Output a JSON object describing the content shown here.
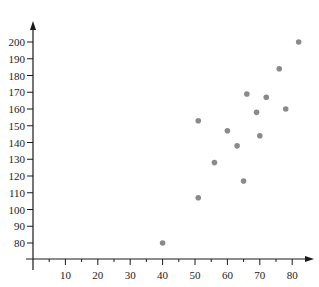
{
  "chart_data": {
    "type": "scatter",
    "title": "",
    "xlabel": "",
    "ylabel": "",
    "xlim": [
      0,
      85
    ],
    "ylim": [
      70,
      205
    ],
    "x_ticks": [
      10,
      20,
      30,
      40,
      50,
      60,
      70,
      80
    ],
    "x_minor_ticks": [
      5,
      15,
      25,
      35,
      45,
      55,
      65,
      75
    ],
    "y_ticks": [
      80,
      90,
      100,
      110,
      120,
      130,
      140,
      150,
      160,
      170,
      180,
      190,
      200
    ],
    "grid": false,
    "legend": null,
    "point_color": "#8a8a8a",
    "axis_color": "#1a1a1a",
    "series": [
      {
        "name": "data",
        "points": [
          {
            "x": 40,
            "y": 80
          },
          {
            "x": 51,
            "y": 107
          },
          {
            "x": 56,
            "y": 128
          },
          {
            "x": 65,
            "y": 117
          },
          {
            "x": 63,
            "y": 138
          },
          {
            "x": 60,
            "y": 147
          },
          {
            "x": 70,
            "y": 144
          },
          {
            "x": 51,
            "y": 153
          },
          {
            "x": 69,
            "y": 158
          },
          {
            "x": 78,
            "y": 160
          },
          {
            "x": 66,
            "y": 169
          },
          {
            "x": 72,
            "y": 167
          },
          {
            "x": 76,
            "y": 184
          },
          {
            "x": 82,
            "y": 200
          }
        ]
      }
    ]
  }
}
